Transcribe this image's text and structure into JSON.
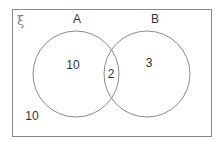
{
  "diagram": {
    "type": "venn",
    "universal_set_symbol": "ξ",
    "sets": [
      {
        "name": "A",
        "label": "A"
      },
      {
        "name": "B",
        "label": "B"
      }
    ],
    "regions": {
      "only_a": "10",
      "a_and_b": "2",
      "only_b": "3",
      "outside": "10"
    },
    "colors": {
      "stroke": "#8a8a8a",
      "text": "#333333",
      "background": "#ffffff"
    }
  }
}
